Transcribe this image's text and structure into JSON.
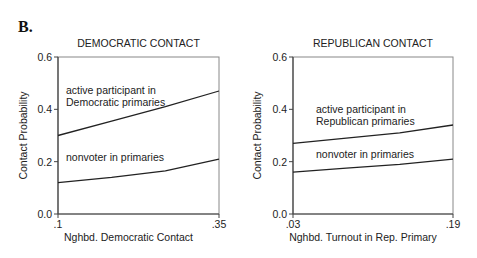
{
  "figure": {
    "panel_label": "B."
  },
  "chart_data": [
    {
      "type": "line",
      "title": "DEMOCRATIC CONTACT",
      "xlabel": "Nghbd. Democratic Contact",
      "ylabel": "Contact Probability",
      "xlim": [
        0.1,
        0.35
      ],
      "ylim": [
        0.0,
        0.6
      ],
      "x_ticks": [
        ".1",
        ".35"
      ],
      "y_ticks": [
        "0.0",
        "0.2",
        "0.4",
        "0.6"
      ],
      "grid": false,
      "legend": "inline annotations",
      "x": [
        0.1,
        0.1833,
        0.2667,
        0.35
      ],
      "series": [
        {
          "name": "active participant in Democratic primaries",
          "label_lines": [
            "active participant in",
            "Democratic primaries"
          ],
          "values": [
            0.3,
            0.355,
            0.41,
            0.47
          ]
        },
        {
          "name": "nonvoter in primaries",
          "label_lines": [
            "nonvoter in primaries"
          ],
          "values": [
            0.12,
            0.14,
            0.165,
            0.21
          ]
        }
      ]
    },
    {
      "type": "line",
      "title": "REPUBLICAN CONTACT",
      "xlabel": "Nghbd. Turnout in Rep. Primary",
      "ylabel": "Contact Probability",
      "xlim": [
        0.03,
        0.19
      ],
      "ylim": [
        0.0,
        0.6
      ],
      "x_ticks": [
        ".03",
        ".19"
      ],
      "y_ticks": [
        "0.0",
        "0.2",
        "0.4",
        "0.6"
      ],
      "grid": false,
      "legend": "inline annotations",
      "x": [
        0.03,
        0.0833,
        0.1367,
        0.19
      ],
      "series": [
        {
          "name": "active participant in Republican primaries",
          "label_lines": [
            "active participant in",
            "Republican primaries"
          ],
          "values": [
            0.27,
            0.29,
            0.31,
            0.34
          ]
        },
        {
          "name": "nonvoter in primaries",
          "label_lines": [
            "nonvoter in primaries"
          ],
          "values": [
            0.16,
            0.175,
            0.19,
            0.21
          ]
        }
      ]
    }
  ]
}
